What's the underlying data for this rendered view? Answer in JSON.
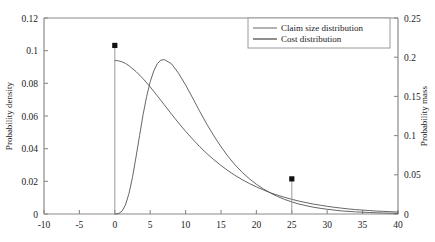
{
  "chart_data": {
    "type": "line",
    "title": "",
    "xlabel": "",
    "ylabel": "Probability density",
    "y2label": "Probability mass",
    "xlim": [
      -10,
      40
    ],
    "ylim": [
      0,
      0.12
    ],
    "y2lim": [
      0,
      0.25
    ],
    "grid": false,
    "legend_position": "top-right",
    "xticks": [
      "-10",
      "-5",
      "0",
      "5",
      "10",
      "15",
      "20",
      "25",
      "30",
      "35",
      "40"
    ],
    "xtick_values": [
      -10,
      -5,
      0,
      5,
      10,
      15,
      20,
      25,
      30,
      35,
      40
    ],
    "yticks": [
      "0",
      "0.02",
      "0.04",
      "0.06",
      "0.08",
      "0.1",
      "0.12"
    ],
    "ytick_values": [
      0,
      0.02,
      0.04,
      0.06,
      0.08,
      0.1,
      0.12
    ],
    "y2ticks": [
      "0",
      "0.05",
      "0.1",
      "0.15",
      "0.2",
      "0.25"
    ],
    "y2tick_values": [
      0,
      0.05,
      0.1,
      0.15,
      0.2,
      0.25
    ],
    "series": [
      {
        "name": "Claim size distribution",
        "axis": "left",
        "color": "#555555",
        "x": [
          0,
          0.5,
          1,
          1.5,
          2,
          3,
          4,
          5,
          6,
          7,
          8,
          9,
          10,
          11,
          12,
          13,
          14,
          15,
          16,
          17,
          18,
          19,
          20,
          21,
          22,
          23,
          24,
          25,
          26,
          27,
          28,
          29,
          30,
          31,
          32,
          33,
          34,
          35,
          36,
          37,
          38,
          39,
          40
        ],
        "values": [
          0.094,
          0.0938,
          0.0932,
          0.0922,
          0.0908,
          0.0872,
          0.0828,
          0.0778,
          0.0724,
          0.0668,
          0.0612,
          0.0558,
          0.0506,
          0.0458,
          0.0412,
          0.037,
          0.0332,
          0.0297,
          0.0265,
          0.0236,
          0.021,
          0.0187,
          0.0166,
          0.0147,
          0.013,
          0.0115,
          0.0102,
          0.009,
          0.0079,
          0.007,
          0.0061,
          0.0054,
          0.0047,
          0.0041,
          0.0036,
          0.0031,
          0.0027,
          0.0024,
          0.0021,
          0.0018,
          0.0016,
          0.0014,
          0.0012
        ]
      },
      {
        "name": "Cost distribution",
        "axis": "left",
        "color": "#555555",
        "x": [
          0,
          0.5,
          1,
          1.5,
          2,
          2.5,
          3,
          3.5,
          4,
          4.5,
          5,
          5.5,
          6,
          6.5,
          7,
          8,
          9,
          10,
          11,
          12,
          13,
          14,
          15,
          16,
          17,
          18,
          19,
          20,
          21,
          22,
          23,
          24,
          25,
          26,
          27,
          28,
          29,
          30,
          32,
          34,
          36,
          38,
          40
        ],
        "values": [
          0.0,
          0.0002,
          0.0016,
          0.0055,
          0.0125,
          0.0225,
          0.035,
          0.048,
          0.061,
          0.072,
          0.081,
          0.0875,
          0.092,
          0.0942,
          0.0945,
          0.092,
          0.0862,
          0.079,
          0.071,
          0.0628,
          0.055,
          0.0478,
          0.0412,
          0.0352,
          0.03,
          0.0255,
          0.0216,
          0.0182,
          0.0153,
          0.0128,
          0.0107,
          0.0089,
          0.0074,
          0.0061,
          0.0051,
          0.0042,
          0.0035,
          0.0029,
          0.0019,
          0.0013,
          0.0009,
          0.0006,
          0.0004
        ]
      }
    ],
    "mass_points": [
      {
        "x": 0,
        "mass": 0.215,
        "label": ""
      },
      {
        "x": 25,
        "mass": 0.0448,
        "label": ""
      }
    ],
    "legend": [
      {
        "label": "Claim size distribution",
        "color": "#555555"
      },
      {
        "label": "Cost distribution",
        "color": "#333333"
      }
    ]
  }
}
